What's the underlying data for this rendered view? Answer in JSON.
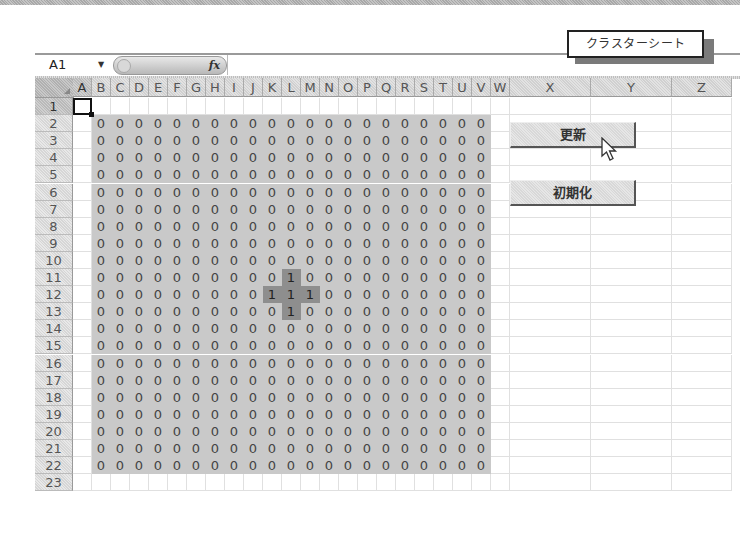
{
  "window": {
    "sheet_label": "クラスターシート"
  },
  "formula_bar": {
    "name_box": "A1",
    "dropdown_icon": "▼",
    "fx_label": "fx",
    "formula_value": ""
  },
  "columns": [
    "A",
    "B",
    "C",
    "D",
    "E",
    "F",
    "G",
    "H",
    "I",
    "J",
    "K",
    "L",
    "M",
    "N",
    "O",
    "P",
    "Q",
    "R",
    "S",
    "T",
    "U",
    "V",
    "W",
    "X",
    "Y",
    "Z"
  ],
  "rows": [
    1,
    2,
    3,
    4,
    5,
    6,
    7,
    8,
    9,
    10,
    11,
    12,
    13,
    14,
    15,
    16,
    17,
    18,
    19,
    20,
    21,
    22,
    23
  ],
  "selected_cell": "A1",
  "data_range": {
    "start_col": "B",
    "end_col": "V",
    "start_row": 2,
    "end_row": 22,
    "default_value": "0",
    "ones": [
      {
        "row": 11,
        "col": "L"
      },
      {
        "row": 12,
        "col": "K"
      },
      {
        "row": 12,
        "col": "L"
      },
      {
        "row": 12,
        "col": "M"
      },
      {
        "row": 13,
        "col": "L"
      }
    ]
  },
  "buttons": {
    "update": "更新",
    "reset": "初期化"
  },
  "colors": {
    "fill_zero": "#c9c9c9",
    "fill_one": "#8e8e8e"
  }
}
